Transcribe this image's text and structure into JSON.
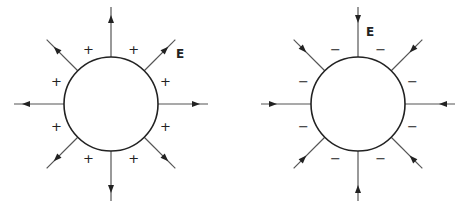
{
  "diagram": {
    "title": "",
    "panels": [
      {
        "name": "positive-charge-sphere",
        "center": [
          111,
          104
        ],
        "radius": 47,
        "charge_sign": "+",
        "field_direction": "outward",
        "field_label": "E",
        "field_label_pos": [
          176,
          58
        ],
        "line_count": 8
      },
      {
        "name": "negative-charge-sphere",
        "center": [
          358,
          104
        ],
        "radius": 47,
        "charge_sign": "−",
        "field_direction": "inward",
        "field_label": "E",
        "field_label_pos": [
          366,
          36
        ],
        "line_count": 8
      }
    ],
    "colors": {
      "stroke": "#222222",
      "line": "#555555"
    }
  }
}
